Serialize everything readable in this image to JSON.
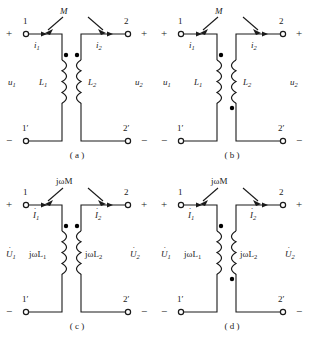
{
  "figure": {
    "type": "circuit-diagram",
    "panel_count": 4
  },
  "panels": [
    {
      "id": "a",
      "caption": "( a )",
      "domain": "time",
      "coupling_label": "M",
      "left_inductor_label": "L",
      "left_inductor_sub": "1",
      "right_inductor_label": "L",
      "right_inductor_sub": "2",
      "left_voltage_label": "u",
      "left_voltage_sub": "1",
      "right_voltage_label": "u",
      "right_voltage_sub": "2",
      "left_current_label": "i",
      "left_current_sub": "1",
      "right_current_label": "i",
      "right_current_sub": "2",
      "terminal_top_left": "1",
      "terminal_top_right": "2",
      "terminal_bottom_left": "1′",
      "terminal_bottom_right": "2′",
      "sign_top_left": "+",
      "sign_top_right": "+",
      "sign_bottom_left": "−",
      "sign_bottom_right": "−",
      "dot_left_position": "top",
      "dot_right_position": "top",
      "phasor": false
    },
    {
      "id": "b",
      "caption": "( b )",
      "domain": "time",
      "coupling_label": "M",
      "left_inductor_label": "L",
      "left_inductor_sub": "1",
      "right_inductor_label": "L",
      "right_inductor_sub": "2",
      "left_voltage_label": "u",
      "left_voltage_sub": "1",
      "right_voltage_label": "u",
      "right_voltage_sub": "2",
      "left_current_label": "i",
      "left_current_sub": "1",
      "right_current_label": "i",
      "right_current_sub": "2",
      "terminal_top_left": "1",
      "terminal_top_right": "2",
      "terminal_bottom_left": "1′",
      "terminal_bottom_right": "2′",
      "sign_top_left": "+",
      "sign_top_right": "+",
      "sign_bottom_left": "−",
      "sign_bottom_right": "−",
      "dot_left_position": "top",
      "dot_right_position": "bottom",
      "phasor": false
    },
    {
      "id": "c",
      "caption": "( c )",
      "domain": "phasor",
      "coupling_label": "jωM",
      "left_inductor_label": "jωL",
      "left_inductor_sub": "1",
      "right_inductor_label": "jωL",
      "right_inductor_sub": "2",
      "left_voltage_label": "U",
      "left_voltage_sub": "1",
      "right_voltage_label": "U",
      "right_voltage_sub": "2",
      "left_current_label": "I",
      "left_current_sub": "1",
      "right_current_label": "I",
      "right_current_sub": "2",
      "terminal_top_left": "1",
      "terminal_top_right": "2",
      "terminal_bottom_left": "1′",
      "terminal_bottom_right": "2′",
      "sign_top_left": "+",
      "sign_top_right": "+",
      "sign_bottom_left": "−",
      "sign_bottom_right": "−",
      "dot_left_position": "top",
      "dot_right_position": "top",
      "phasor": true
    },
    {
      "id": "d",
      "caption": "( d )",
      "domain": "phasor",
      "coupling_label": "jωM",
      "left_inductor_label": "jωL",
      "left_inductor_sub": "1",
      "right_inductor_label": "jωL",
      "right_inductor_sub": "2",
      "left_voltage_label": "U",
      "left_voltage_sub": "1",
      "right_voltage_label": "U",
      "right_voltage_sub": "2",
      "left_current_label": "I",
      "left_current_sub": "1",
      "right_current_label": "I",
      "right_current_sub": "2",
      "terminal_top_left": "1",
      "terminal_top_right": "2",
      "terminal_bottom_left": "1′",
      "terminal_bottom_right": "2′",
      "sign_top_left": "+",
      "sign_top_right": "+",
      "sign_bottom_left": "−",
      "sign_bottom_right": "−",
      "dot_left_position": "bottom",
      "dot_right_position": "bottom",
      "phasor": true
    }
  ],
  "style": {
    "wire_color": "#1a1a1a",
    "background": "#ffffff",
    "dot_color": "#000000"
  }
}
